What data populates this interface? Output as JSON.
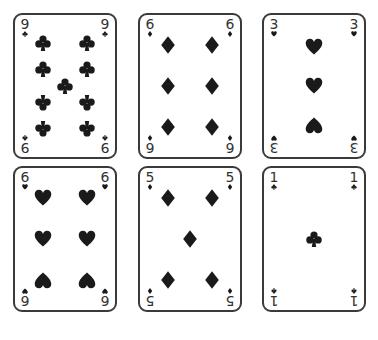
{
  "game": {
    "type": "playing-cards",
    "layout": {
      "rows": 2,
      "cols": 3
    },
    "ink_color": "#1a1a1a",
    "border_color": "#3a3a3a",
    "cards": [
      {
        "rank": "9",
        "suit": "clubs"
      },
      {
        "rank": "6",
        "suit": "diamonds"
      },
      {
        "rank": "3",
        "suit": "hearts"
      },
      {
        "rank": "6",
        "suit": "hearts"
      },
      {
        "rank": "5",
        "suit": "diamonds"
      },
      {
        "rank": "1",
        "suit": "clubs"
      }
    ]
  }
}
